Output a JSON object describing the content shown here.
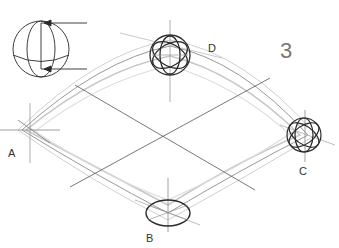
{
  "figure": {
    "number": "3",
    "points": [
      {
        "id": "A",
        "label": "A",
        "x": 8,
        "y": 148
      },
      {
        "id": "B",
        "label": "B",
        "x": 146,
        "y": 233
      },
      {
        "id": "C",
        "label": "C",
        "x": 302,
        "y": 166
      },
      {
        "id": "D",
        "label": "D",
        "x": 208,
        "y": 43
      }
    ],
    "inset": "Sphere rotation diagram with arrows indicating top and bottom axis points",
    "colors": {
      "stroke_dark": "#2a2a2a",
      "stroke_mid": "#666666",
      "stroke_light": "#b5b5b5",
      "background": "#ffffff"
    }
  }
}
